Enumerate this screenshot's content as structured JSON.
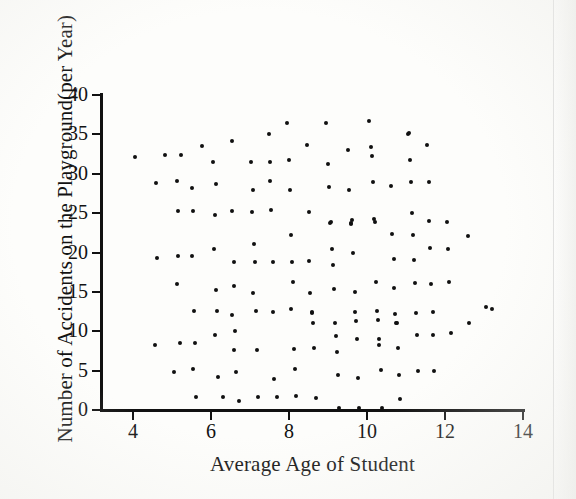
{
  "figure": {
    "background_color": "#fdfdfb",
    "ink_color": "#101010"
  },
  "chart_data": {
    "type": "scatter",
    "title": "",
    "xlabel": "Average Age of Student",
    "ylabel": "Number of Accidents on the Playground(per Year)",
    "xlim": [
      3.0,
      14.0
    ],
    "ylim": [
      0,
      40
    ],
    "xticks": [
      4,
      6,
      8,
      10,
      12,
      14
    ],
    "yticks": [
      0,
      5,
      10,
      15,
      20,
      25,
      30,
      35,
      40
    ],
    "grid": false,
    "legend": null,
    "marker": "dot",
    "marker_color": "#101010",
    "n_points": 152,
    "relationship": "no correlation",
    "points": [
      [
        4.06,
        32.1
      ],
      [
        4.6,
        28.8
      ],
      [
        4.62,
        19.3
      ],
      [
        4.57,
        8.2
      ],
      [
        4.82,
        32.4
      ],
      [
        5.04,
        4.8
      ],
      [
        5.12,
        29.1
      ],
      [
        5.22,
        32.4
      ],
      [
        5.16,
        25.3
      ],
      [
        5.15,
        19.5
      ],
      [
        5.12,
        16.0
      ],
      [
        5.2,
        8.5
      ],
      [
        5.52,
        28.2
      ],
      [
        5.55,
        25.3
      ],
      [
        5.5,
        19.5
      ],
      [
        5.56,
        12.6
      ],
      [
        5.58,
        8.5
      ],
      [
        5.55,
        5.2
      ],
      [
        5.62,
        1.7
      ],
      [
        5.78,
        33.5
      ],
      [
        6.05,
        31.5
      ],
      [
        6.12,
        28.7
      ],
      [
        6.1,
        24.8
      ],
      [
        6.08,
        20.5
      ],
      [
        6.12,
        15.2
      ],
      [
        6.15,
        12.6
      ],
      [
        6.1,
        9.5
      ],
      [
        6.18,
        4.2
      ],
      [
        6.3,
        1.7
      ],
      [
        6.55,
        34.2
      ],
      [
        6.55,
        25.3
      ],
      [
        6.58,
        18.8
      ],
      [
        6.6,
        15.8
      ],
      [
        6.55,
        12.1
      ],
      [
        6.62,
        10.0
      ],
      [
        6.6,
        7.6
      ],
      [
        6.65,
        4.8
      ],
      [
        6.72,
        1.2
      ],
      [
        7.02,
        31.5
      ],
      [
        7.08,
        27.9
      ],
      [
        7.05,
        25.2
      ],
      [
        7.1,
        21.1
      ],
      [
        7.12,
        18.8
      ],
      [
        7.08,
        14.9
      ],
      [
        7.15,
        12.6
      ],
      [
        7.18,
        7.6
      ],
      [
        7.2,
        1.7
      ],
      [
        7.48,
        35.1
      ],
      [
        7.52,
        31.5
      ],
      [
        7.5,
        29.1
      ],
      [
        7.55,
        25.4
      ],
      [
        7.58,
        18.8
      ],
      [
        7.6,
        12.5
      ],
      [
        7.62,
        3.9
      ],
      [
        7.68,
        1.6
      ],
      [
        7.95,
        36.5
      ],
      [
        8.0,
        31.8
      ],
      [
        8.02,
        27.9
      ],
      [
        8.05,
        22.2
      ],
      [
        8.08,
        18.8
      ],
      [
        8.1,
        16.3
      ],
      [
        8.05,
        12.8
      ],
      [
        8.12,
        7.7
      ],
      [
        8.15,
        5.2
      ],
      [
        8.18,
        1.8
      ],
      [
        8.45,
        33.6
      ],
      [
        8.5,
        25.1
      ],
      [
        8.52,
        18.9
      ],
      [
        8.55,
        14.9
      ],
      [
        8.58,
        12.3
      ],
      [
        8.6,
        12.4
      ],
      [
        8.62,
        11.1
      ],
      [
        8.65,
        7.9
      ],
      [
        8.7,
        1.5
      ],
      [
        8.95,
        36.4
      ],
      [
        9.0,
        31.3
      ],
      [
        9.02,
        28.3
      ],
      [
        9.05,
        23.8
      ],
      [
        9.08,
        23.9
      ],
      [
        9.1,
        20.4
      ],
      [
        9.12,
        18.4
      ],
      [
        9.15,
        15.4
      ],
      [
        9.18,
        11.1
      ],
      [
        9.2,
        9.4
      ],
      [
        9.22,
        7.4
      ],
      [
        9.25,
        4.5
      ],
      [
        9.28,
        0.2
      ],
      [
        9.52,
        33.0
      ],
      [
        9.55,
        27.9
      ],
      [
        9.58,
        23.6
      ],
      [
        9.6,
        23.8
      ],
      [
        9.62,
        24.1
      ],
      [
        9.65,
        20.0
      ],
      [
        9.68,
        15.0
      ],
      [
        9.7,
        12.4
      ],
      [
        9.72,
        11.3
      ],
      [
        9.75,
        9.0
      ],
      [
        9.78,
        4.1
      ],
      [
        9.8,
        0.3
      ],
      [
        10.05,
        36.7
      ],
      [
        10.1,
        33.4
      ],
      [
        10.12,
        32.2
      ],
      [
        10.15,
        29.0
      ],
      [
        10.18,
        24.2
      ],
      [
        10.2,
        23.9
      ],
      [
        10.22,
        16.2
      ],
      [
        10.25,
        12.6
      ],
      [
        10.28,
        11.4
      ],
      [
        10.3,
        9.0
      ],
      [
        10.32,
        8.3
      ],
      [
        10.35,
        5.1
      ],
      [
        10.38,
        0.3
      ],
      [
        10.62,
        28.4
      ],
      [
        10.65,
        22.3
      ],
      [
        10.68,
        19.2
      ],
      [
        10.7,
        15.5
      ],
      [
        10.72,
        12.2
      ],
      [
        10.75,
        11.0
      ],
      [
        10.78,
        11.1
      ],
      [
        10.8,
        7.9
      ],
      [
        10.82,
        4.4
      ],
      [
        10.85,
        1.4
      ],
      [
        11.05,
        35.1
      ],
      [
        11.08,
        35.2
      ],
      [
        11.1,
        31.7
      ],
      [
        11.12,
        29.0
      ],
      [
        11.15,
        25.0
      ],
      [
        11.18,
        22.2
      ],
      [
        11.2,
        19.0
      ],
      [
        11.22,
        16.1
      ],
      [
        11.25,
        12.3
      ],
      [
        11.28,
        9.5
      ],
      [
        11.3,
        4.9
      ],
      [
        11.55,
        33.6
      ],
      [
        11.58,
        28.9
      ],
      [
        11.6,
        24.0
      ],
      [
        11.62,
        20.6
      ],
      [
        11.65,
        16.0
      ],
      [
        11.68,
        12.5
      ],
      [
        11.7,
        9.5
      ],
      [
        11.72,
        5.0
      ],
      [
        12.05,
        23.9
      ],
      [
        12.08,
        20.5
      ],
      [
        12.1,
        16.2
      ],
      [
        12.15,
        9.8
      ],
      [
        12.6,
        22.1
      ],
      [
        12.62,
        11.0
      ],
      [
        13.05,
        13.1
      ],
      [
        13.2,
        12.8
      ]
    ]
  },
  "axis_title_x": "Average Age of Student",
  "axis_title_y": "Number of Accidents on the Playground(per Year)"
}
